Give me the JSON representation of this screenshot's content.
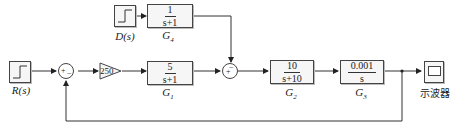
{
  "sources": {
    "R": {
      "label": "R(s)"
    },
    "D": {
      "label": "D(s)"
    }
  },
  "gain": {
    "value": "250"
  },
  "blocks": {
    "G1": {
      "num": "5",
      "den": "s+1",
      "name": "G",
      "sub": "1"
    },
    "G2": {
      "num": "10",
      "den": "s+10",
      "name": "G",
      "sub": "2"
    },
    "G3": {
      "num": "0.001",
      "den": "s",
      "name": "G",
      "sub": "3"
    },
    "G4": {
      "num": "1",
      "den": "s+1",
      "name": "G",
      "sub": "4"
    }
  },
  "sum1": {
    "sign_left": "+",
    "sign_bottom": "−"
  },
  "sum2": {
    "sign_left": "+",
    "sign_top": "−"
  },
  "scope": {
    "label": "示波器"
  }
}
